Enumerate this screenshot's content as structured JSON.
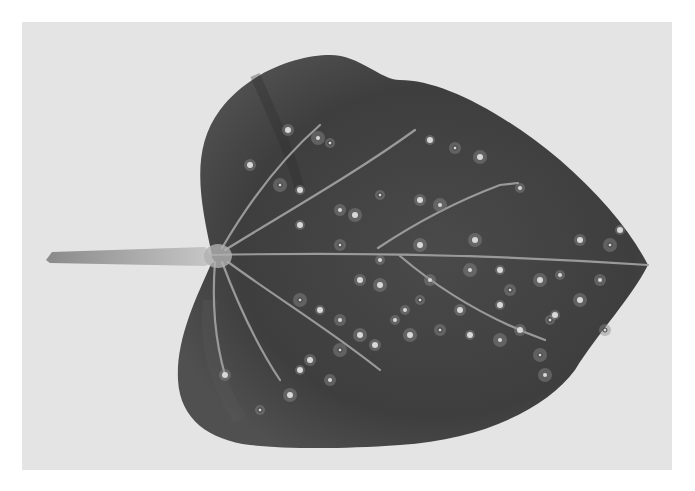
{
  "image": {
    "description": "Grayscale photograph of a heart-shaped leaf with petiole on the left, showing numerous small pale lesion spots",
    "colors": {
      "border": "#ffffff",
      "background": "#e4e4e4",
      "leaf_dark": "#3c3c3c",
      "leaf_mid": "#555555",
      "vein": "#9a9a9a",
      "petiole": "#b4b4b4",
      "spot": "#d8d8d8"
    },
    "spots": [
      [
        330,
        143
      ],
      [
        288,
        130
      ],
      [
        318,
        138
      ],
      [
        430,
        140
      ],
      [
        455,
        148
      ],
      [
        480,
        157
      ],
      [
        520,
        188
      ],
      [
        250,
        165
      ],
      [
        280,
        185
      ],
      [
        300,
        190
      ],
      [
        340,
        210
      ],
      [
        355,
        215
      ],
      [
        380,
        195
      ],
      [
        420,
        200
      ],
      [
        440,
        205
      ],
      [
        300,
        225
      ],
      [
        340,
        245
      ],
      [
        420,
        245
      ],
      [
        380,
        260
      ],
      [
        360,
        280
      ],
      [
        300,
        300
      ],
      [
        320,
        310
      ],
      [
        340,
        320
      ],
      [
        380,
        285
      ],
      [
        420,
        300
      ],
      [
        460,
        310
      ],
      [
        470,
        270
      ],
      [
        500,
        270
      ],
      [
        510,
        290
      ],
      [
        540,
        280
      ],
      [
        560,
        275
      ],
      [
        580,
        240
      ],
      [
        610,
        245
      ],
      [
        620,
        230
      ],
      [
        600,
        280
      ],
      [
        580,
        300
      ],
      [
        550,
        320
      ],
      [
        520,
        330
      ],
      [
        500,
        340
      ],
      [
        470,
        335
      ],
      [
        440,
        330
      ],
      [
        410,
        335
      ],
      [
        395,
        320
      ],
      [
        375,
        345
      ],
      [
        340,
        350
      ],
      [
        300,
        370
      ],
      [
        330,
        380
      ],
      [
        290,
        395
      ],
      [
        260,
        410
      ],
      [
        225,
        375
      ],
      [
        545,
        375
      ],
      [
        555,
        315
      ],
      [
        605,
        330
      ],
      [
        360,
        335
      ],
      [
        405,
        310
      ],
      [
        310,
        360
      ],
      [
        540,
        355
      ],
      [
        500,
        305
      ],
      [
        430,
        280
      ],
      [
        475,
        240
      ]
    ]
  }
}
